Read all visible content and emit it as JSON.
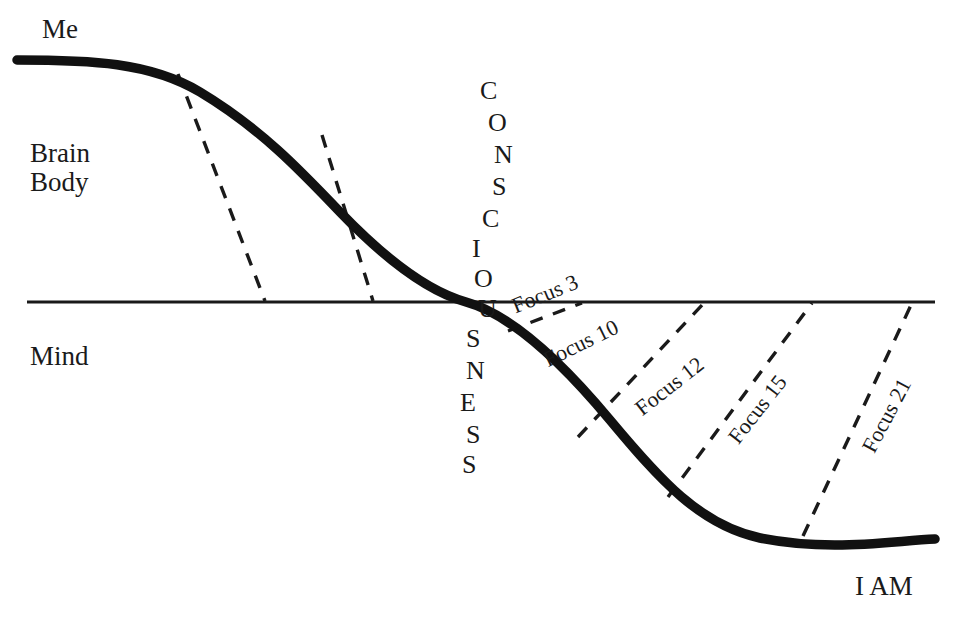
{
  "diagram": {
    "colors": {
      "ink": "#1a1a1a",
      "background": "#ffffff",
      "curve": "#111111",
      "axis": "#1a1a1a",
      "dashed": "#1a1a1a"
    },
    "labels": {
      "me": "Me",
      "brain": "Brain",
      "body": "Body",
      "mind": "Mind",
      "i_am": "I AM"
    },
    "consciousness_word": {
      "text": "CONSCIOUSNESS",
      "letters": [
        {
          "char": "C",
          "x": 480,
          "y": 78
        },
        {
          "char": "O",
          "x": 488,
          "y": 110
        },
        {
          "char": "N",
          "x": 494,
          "y": 142
        },
        {
          "char": "S",
          "x": 492,
          "y": 174
        },
        {
          "char": "C",
          "x": 482,
          "y": 206
        },
        {
          "char": "I",
          "x": 472,
          "y": 236
        },
        {
          "char": "O",
          "x": 474,
          "y": 266
        },
        {
          "char": "U",
          "x": 478,
          "y": 296
        },
        {
          "char": "S",
          "x": 466,
          "y": 326
        },
        {
          "char": "N",
          "x": 466,
          "y": 358
        },
        {
          "char": "E",
          "x": 460,
          "y": 390
        },
        {
          "char": "S",
          "x": 466,
          "y": 422
        },
        {
          "char": "S",
          "x": 462,
          "y": 452
        }
      ]
    },
    "focus_bands": [
      {
        "label": "Focus 3",
        "x": 513,
        "y": 296,
        "rotation": -22
      },
      {
        "label": "Focus 10",
        "x": 545,
        "y": 350,
        "rotation": -26
      },
      {
        "label": "Focus 12",
        "x": 638,
        "y": 400,
        "rotation": -38
      },
      {
        "label": "Focus 15",
        "x": 733,
        "y": 430,
        "rotation": -52
      },
      {
        "label": "Focus 21",
        "x": 868,
        "y": 440,
        "rotation": -62
      }
    ],
    "axis_line": {
      "name": "consciousness-boundary",
      "x1": 27,
      "y1": 302,
      "x2": 935,
      "y2": 302
    },
    "main_curve": {
      "name": "consciousness-gradient-curve",
      "description": "sigmoid descending from Me/Brain/Body through the boundary to I AM",
      "path": "M 17 60 C 90 60, 150 62, 200 92 C 260 128, 300 170, 340 212 C 390 264, 430 292, 466 302 C 510 314, 560 360, 610 420 C 660 480, 700 525, 760 538 C 830 552, 890 541, 935 539"
    },
    "dashed_lines": [
      {
        "name": "divider-upper-1",
        "x1": 178,
        "y1": 74,
        "x2": 265,
        "y2": 301
      },
      {
        "name": "divider-upper-2",
        "x1": 322,
        "y1": 135,
        "x2": 373,
        "y2": 301
      },
      {
        "name": "divider-focus-3",
        "x1": 508,
        "y1": 331,
        "x2": 582,
        "y2": 303
      },
      {
        "name": "divider-focus-10",
        "x1": 578,
        "y1": 437,
        "x2": 704,
        "y2": 303
      },
      {
        "name": "divider-focus-12",
        "x1": 668,
        "y1": 497,
        "x2": 812,
        "y2": 303
      },
      {
        "name": "divider-focus-15",
        "x1": 803,
        "y1": 536,
        "x2": 912,
        "y2": 303
      }
    ]
  },
  "chart_data": {
    "type": "line",
    "xlabel": "",
    "ylabel": "",
    "grid": false,
    "legend": "none",
    "annotations": [
      "Me",
      "Brain",
      "Body",
      "Mind",
      "I AM",
      "CONSCIOUSNESS"
    ],
    "regions": [
      "Focus 3",
      "Focus 10",
      "Focus 12",
      "Focus 15",
      "Focus 21"
    ],
    "series": [
      {
        "name": "consciousness-gradient",
        "x": [
          17,
          178,
          265,
          322,
          373,
          466,
          508,
          582,
          668,
          760,
          803,
          935
        ],
        "y": [
          60,
          74,
          120,
          135,
          205,
          302,
          331,
          400,
          497,
          538,
          536,
          539
        ]
      }
    ],
    "axis_crossing": {
      "x": 466,
      "y": 302
    }
  }
}
